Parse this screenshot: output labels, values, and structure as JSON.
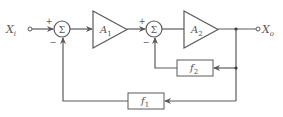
{
  "diagram": {
    "title": "",
    "colors": {
      "line": "#5a5a5a",
      "text": "#555555",
      "background": "#ffffff"
    },
    "input": {
      "label": "X",
      "subscript": "i"
    },
    "output": {
      "label": "X",
      "subscript": "o"
    },
    "summers": [
      {
        "id": "sum1",
        "symbol": "Σ",
        "plus_label": "+",
        "minus_label": "−"
      },
      {
        "id": "sum2",
        "symbol": "Σ",
        "plus_label": "+",
        "minus_label": "−"
      }
    ],
    "amplifiers": [
      {
        "id": "A1",
        "label": "A",
        "subscript": "1"
      },
      {
        "id": "A2",
        "label": "A",
        "subscript": "2"
      }
    ],
    "feedback_blocks": [
      {
        "id": "f2",
        "label": "f",
        "subscript": "2"
      },
      {
        "id": "f1",
        "label": "f",
        "subscript": "1"
      }
    ],
    "connections": [
      "X_i -> sum1(+)",
      "sum1 -> A1",
      "A1 -> sum2(+)",
      "sum2 -> A2",
      "A2 -> X_o",
      "X_o -> f2 -> sum2(-)",
      "X_o -> f1 -> sum1(-)"
    ]
  }
}
